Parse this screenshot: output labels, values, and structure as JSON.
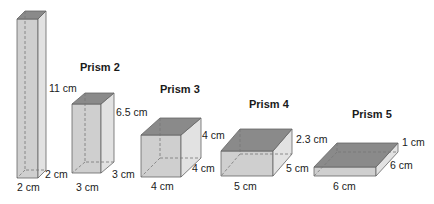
{
  "colors": {
    "front": "#cfcfcf",
    "side": "#e2e2e2",
    "top": "#8a8a8a",
    "edge": "#666666",
    "hidden": "#777777",
    "text": "#1a1a1a"
  },
  "prisms": [
    {
      "title": "",
      "height": "11 cm",
      "depth": "2 cm",
      "width": "2 cm"
    },
    {
      "title": "Prism 2",
      "height": "6.5 cm",
      "depth": "3 cm",
      "width": "3 cm"
    },
    {
      "title": "Prism 3",
      "height": "4 cm",
      "depth": "4 cm",
      "width": "4 cm"
    },
    {
      "title": "Prism 4",
      "height": "2.3 cm",
      "depth": "5 cm",
      "width": "5 cm"
    },
    {
      "title": "Prism 5",
      "height": "1 cm",
      "depth": "6 cm",
      "width": "6 cm"
    }
  ]
}
